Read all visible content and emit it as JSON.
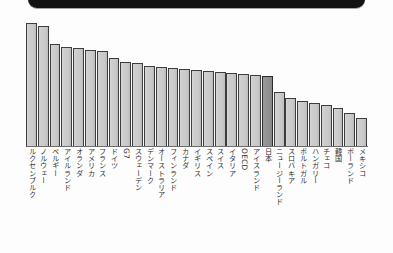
{
  "figure": {
    "title_band": {
      "visible_text": "",
      "color": "#131313",
      "description": "black-rounded-banner-bottom-edge"
    }
  },
  "colors": {
    "bar_fill": "#cdcdcd",
    "bar_edge": "#3d3d3d",
    "highlight_fill": "#909090",
    "highlight_edge": "#2c2c2c",
    "axis": "#6e6e6e",
    "label_text": "#2f2f2f",
    "background": "#ffffff"
  },
  "chart_data": {
    "type": "bar",
    "title": "",
    "subtitle": "",
    "xlabel": "",
    "ylabel": "",
    "grid": false,
    "legend": "none",
    "ylim": [
      0,
      125
    ],
    "highlight_category": "日本",
    "categories": [
      "ルクセンブルク",
      "ノルウェー",
      "ベルギー",
      "アイルランド",
      "オランダ",
      "アメリカ",
      "フランス",
      "ドイツ",
      "G7",
      "スウェーデン",
      "デンマーク",
      "オーストラリア",
      "フィンランド",
      "カナダ",
      "イギリス",
      "スペイン",
      "スイス",
      "イタリア",
      "OECD",
      "アイスランド",
      "日本",
      "ニュージーランド",
      "スロバキア",
      "ポルトガル",
      "ハンガリー",
      "チェコ",
      "韓国",
      "ポーランド",
      "メキシコ"
    ],
    "values": [
      124,
      121,
      103,
      100,
      99,
      97,
      96,
      89,
      85,
      84,
      81,
      80,
      79,
      78,
      77,
      76,
      75,
      74,
      73,
      72,
      71,
      54,
      48,
      45,
      43,
      41,
      38,
      33,
      28
    ],
    "tick_labels": [],
    "annotations": []
  }
}
